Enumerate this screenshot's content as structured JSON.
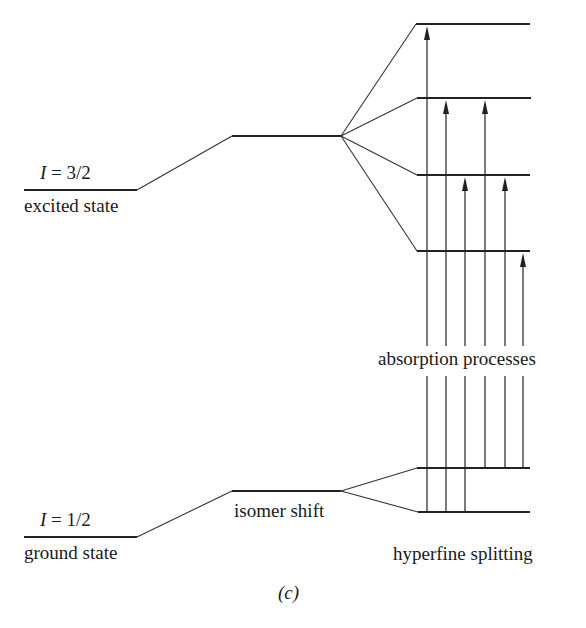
{
  "diagram": {
    "type": "energy-level-diagram",
    "panel_label": "(c)",
    "excited": {
      "spin_label_symbol": "I",
      "spin_label_value": " = 3/2",
      "state_label": "excited state",
      "hyperfine_levels": 4
    },
    "ground": {
      "spin_label_symbol": "I",
      "spin_label_value": " = 1/2",
      "state_label": "ground state",
      "hyperfine_levels": 2
    },
    "labels": {
      "isomer_shift": "isomer shift",
      "hyperfine_splitting": "hyperfine splitting",
      "absorption_processes": "absorption processes"
    },
    "transitions": [
      {
        "from": "ground-lower",
        "to": "excited-1"
      },
      {
        "from": "ground-lower",
        "to": "excited-2"
      },
      {
        "from": "ground-lower",
        "to": "excited-3"
      },
      {
        "from": "ground-upper",
        "to": "excited-2"
      },
      {
        "from": "ground-upper",
        "to": "excited-3"
      },
      {
        "from": "ground-upper",
        "to": "excited-4"
      }
    ],
    "colors": {
      "line": "#222222",
      "background": "#ffffff"
    }
  }
}
